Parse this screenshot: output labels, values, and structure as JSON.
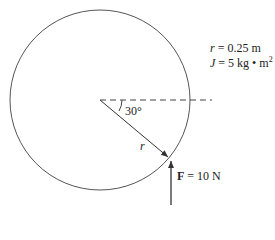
{
  "diagram": {
    "params": {
      "r_symbol": "r",
      "r_value": " = 0.25 m",
      "J_symbol": "J",
      "J_value": " = 5 kg • m",
      "J_exponent": "2"
    },
    "angle_label": "30°",
    "radius_label": "r",
    "force_symbol": "F",
    "force_value": " = 10 N",
    "colors": {
      "stroke": "#555555",
      "text": "#222222"
    }
  }
}
